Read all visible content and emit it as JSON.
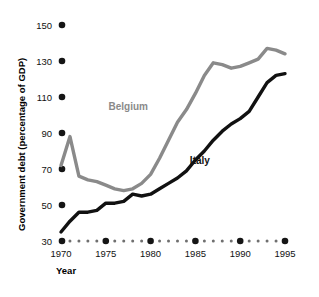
{
  "chart_data": {
    "type": "line",
    "title": "",
    "xlabel": "Year",
    "ylabel": "Government debt (percentage of GDP)",
    "xlim": [
      1970,
      1995
    ],
    "ylim": [
      30,
      150
    ],
    "yticks": [
      30,
      50,
      70,
      90,
      110,
      130,
      150
    ],
    "xticks": [
      1970,
      1975,
      1980,
      1985,
      1990,
      1995
    ],
    "xticklabels": [
      "1970",
      "1975",
      "1980",
      "1985",
      "1990",
      "1995"
    ],
    "yticklabels": [
      "30",
      "50",
      "70",
      "90",
      "110",
      "130",
      "150"
    ],
    "grid": false,
    "legend_position": "inline-annotation",
    "x": [
      1970,
      1971,
      1972,
      1973,
      1974,
      1975,
      1976,
      1977,
      1978,
      1979,
      1980,
      1981,
      1982,
      1983,
      1984,
      1985,
      1986,
      1987,
      1988,
      1989,
      1990,
      1991,
      1992,
      1993,
      1994,
      1995
    ],
    "series": [
      {
        "name": "Belgium",
        "color": "#8a8a8a",
        "values": [
          72,
          88,
          66,
          64,
          63,
          61,
          59,
          58,
          59,
          62,
          67,
          76,
          86,
          96,
          103,
          112,
          122,
          129,
          128,
          126,
          127,
          129,
          131,
          137,
          136,
          134
        ]
      },
      {
        "name": "Italy",
        "color": "#111111",
        "values": [
          35,
          41,
          46,
          46,
          47,
          51,
          51,
          52,
          56,
          55,
          56,
          59,
          62,
          65,
          69,
          75,
          80,
          86,
          91,
          95,
          98,
          102,
          110,
          118,
          122,
          123
        ]
      }
    ],
    "annotations": [
      {
        "text": "Belgium",
        "x": 1977.5,
        "y": 103,
        "color": "#8a8a8a"
      },
      {
        "text": "Italy",
        "x": 1985.5,
        "y": 73,
        "color": "#111111"
      }
    ]
  },
  "axis": {
    "y_title": "Government debt (percentage of GDP)",
    "x_title": "Year"
  }
}
